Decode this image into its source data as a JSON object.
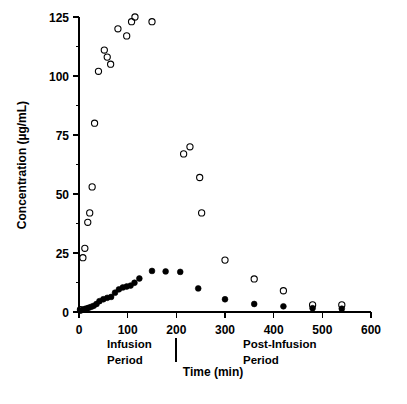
{
  "chart_data": {
    "type": "scatter",
    "title": "",
    "xlabel": "Time (min)",
    "ylabel": "Concentration (µg/mL)",
    "xlim": [
      0,
      600
    ],
    "ylim": [
      0,
      125
    ],
    "xticks": [
      0,
      100,
      200,
      300,
      400,
      500,
      600
    ],
    "xtick_labels": [
      "0",
      "100",
      "200",
      "300",
      "400",
      "500",
      "600"
    ],
    "yticks": [
      0,
      25,
      50,
      75,
      100,
      125
    ],
    "ytick_labels": [
      "0",
      "25",
      "50",
      "75",
      "100",
      "125"
    ],
    "y_minor_ticks": [
      12.5,
      37.5,
      62.5,
      87.5,
      112.5
    ],
    "grid": false,
    "legend_position": "none",
    "series": [
      {
        "name": "open-circle-series",
        "marker": "open-circle",
        "color": "#000000",
        "points": [
          {
            "x": 3,
            "y": 1
          },
          {
            "x": 8,
            "y": 23
          },
          {
            "x": 12,
            "y": 27
          },
          {
            "x": 18,
            "y": 38
          },
          {
            "x": 22,
            "y": 42
          },
          {
            "x": 27,
            "y": 53
          },
          {
            "x": 32,
            "y": 80
          },
          {
            "x": 40,
            "y": 102
          },
          {
            "x": 52,
            "y": 111
          },
          {
            "x": 58,
            "y": 108
          },
          {
            "x": 65,
            "y": 105
          },
          {
            "x": 80,
            "y": 120
          },
          {
            "x": 98,
            "y": 117
          },
          {
            "x": 108,
            "y": 123
          },
          {
            "x": 115,
            "y": 125
          },
          {
            "x": 150,
            "y": 123
          },
          {
            "x": 215,
            "y": 67
          },
          {
            "x": 228,
            "y": 70
          },
          {
            "x": 248,
            "y": 57
          },
          {
            "x": 252,
            "y": 42
          },
          {
            "x": 300,
            "y": 22
          },
          {
            "x": 360,
            "y": 14
          },
          {
            "x": 420,
            "y": 9
          },
          {
            "x": 480,
            "y": 3
          },
          {
            "x": 540,
            "y": 3
          }
        ]
      },
      {
        "name": "filled-circle-series",
        "marker": "filled-circle",
        "color": "#000000",
        "points": [
          {
            "x": 3,
            "y": 0.6
          },
          {
            "x": 8,
            "y": 1.0
          },
          {
            "x": 12,
            "y": 1.3
          },
          {
            "x": 16,
            "y": 1.5
          },
          {
            "x": 20,
            "y": 1.8
          },
          {
            "x": 25,
            "y": 2.2
          },
          {
            "x": 30,
            "y": 2.6
          },
          {
            "x": 36,
            "y": 3.4
          },
          {
            "x": 42,
            "y": 4.6
          },
          {
            "x": 50,
            "y": 5.4
          },
          {
            "x": 58,
            "y": 6.0
          },
          {
            "x": 66,
            "y": 6.4
          },
          {
            "x": 74,
            "y": 8.2
          },
          {
            "x": 82,
            "y": 9.6
          },
          {
            "x": 90,
            "y": 10.4
          },
          {
            "x": 98,
            "y": 10.8
          },
          {
            "x": 106,
            "y": 11.2
          },
          {
            "x": 114,
            "y": 12.4
          },
          {
            "x": 124,
            "y": 14.2
          },
          {
            "x": 150,
            "y": 17.4
          },
          {
            "x": 178,
            "y": 17.2
          },
          {
            "x": 208,
            "y": 17.0
          },
          {
            "x": 245,
            "y": 10.0
          },
          {
            "x": 300,
            "y": 5.4
          },
          {
            "x": 360,
            "y": 3.4
          },
          {
            "x": 420,
            "y": 2.4
          },
          {
            "x": 480,
            "y": 1.6
          },
          {
            "x": 540,
            "y": 1.4
          }
        ]
      }
    ],
    "annotations": [
      {
        "name": "infusion-period",
        "line1": "Infusion",
        "line2": "Period"
      },
      {
        "name": "post-infusion-period",
        "line1": "Post-Infusion",
        "line2": "Period"
      },
      {
        "name": "period-divider",
        "x": 215
      }
    ]
  },
  "labels": {
    "x_axis_title": "Time (min)",
    "y_axis_title": "Concentration (µg/mL)",
    "infusion_line1": "Infusion",
    "infusion_line2": "Period",
    "post_infusion_line1": "Post-Infusion",
    "post_infusion_line2": "Period"
  }
}
